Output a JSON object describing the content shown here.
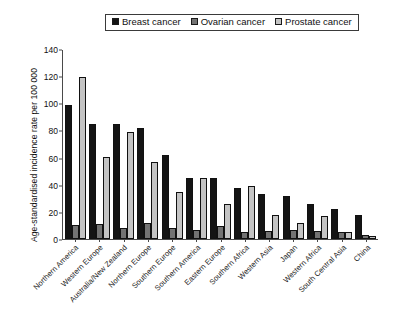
{
  "chart_data": {
    "type": "bar",
    "title": "",
    "xlabel": "",
    "ylabel": "Age-standardised incidence rate per 100 000",
    "ylim": [
      0,
      140
    ],
    "yticks": [
      0,
      20,
      40,
      60,
      80,
      100,
      120,
      140
    ],
    "grid": false,
    "legend_position": "top-center",
    "categories": [
      "Northern America",
      "Western Europe",
      "Australia/New Zealand",
      "Northern Europe",
      "Southern Europe",
      "Southern America",
      "Eastern Europe",
      "Southern Africa",
      "Western Asia",
      "Japan",
      "Western Africa",
      "South Central Asia",
      "China"
    ],
    "series": [
      {
        "name": "Breast cancer",
        "color": "#141414",
        "values": [
          99,
          85,
          85,
          82,
          62,
          45,
          45,
          38,
          33,
          32,
          26,
          22,
          18
        ]
      },
      {
        "name": "Ovarian cancer",
        "color": "#737373",
        "values": [
          10.5,
          11,
          8.5,
          12,
          8,
          7,
          10,
          5,
          6,
          7,
          6,
          5,
          3
        ]
      },
      {
        "name": "Prostate cancer",
        "color": "#c4c4c4",
        "values": [
          120,
          61,
          79,
          57,
          35,
          45,
          26,
          39,
          18,
          12,
          17,
          5,
          2
        ]
      }
    ]
  },
  "legend": {
    "items": [
      {
        "label": "Breast cancer",
        "color": "#141414",
        "icon": "square-swatch-icon"
      },
      {
        "label": "Ovarian cancer",
        "color": "#737373",
        "icon": "square-swatch-icon"
      },
      {
        "label": "Prostate cancer",
        "color": "#c4c4c4",
        "icon": "square-swatch-icon"
      }
    ]
  }
}
